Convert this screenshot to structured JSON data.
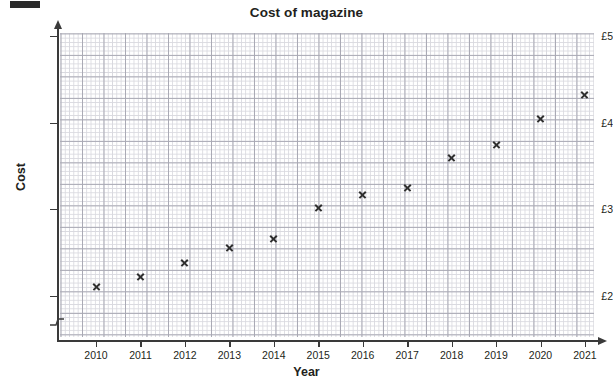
{
  "chart_data": {
    "type": "scatter",
    "title": "Cost of magazine",
    "xlabel": "Year",
    "ylabel": "Cost",
    "x": [
      2010,
      2011,
      2012,
      2013,
      2014,
      2015,
      2016,
      2017,
      2018,
      2019,
      2020,
      2021
    ],
    "values": [
      2.1,
      2.22,
      2.38,
      2.56,
      2.66,
      3.02,
      3.17,
      3.25,
      3.6,
      3.75,
      4.05,
      4.32
    ],
    "points": [
      {
        "year": 2010,
        "cost": 2.1
      },
      {
        "year": 2011,
        "cost": 2.22
      },
      {
        "year": 2012,
        "cost": 2.38
      },
      {
        "year": 2013,
        "cost": 2.56
      },
      {
        "year": 2014,
        "cost": 2.66
      },
      {
        "year": 2015,
        "cost": 3.02
      },
      {
        "year": 2016,
        "cost": 3.17
      },
      {
        "year": 2017,
        "cost": 3.25
      },
      {
        "year": 2018,
        "cost": 3.6
      },
      {
        "year": 2019,
        "cost": 3.75
      },
      {
        "year": 2020,
        "cost": 4.05
      },
      {
        "year": 2021,
        "cost": 4.32
      }
    ],
    "xlim": [
      2009.2,
      2021.5
    ],
    "ylim": [
      1.85,
      5.05
    ],
    "xticks": [
      2010,
      2011,
      2012,
      2013,
      2014,
      2015,
      2016,
      2017,
      2018,
      2019,
      2020,
      2021
    ],
    "xtick_labels": [
      "2010",
      "2011",
      "2012",
      "2013",
      "2014",
      "2015",
      "2016",
      "2017",
      "2018",
      "2019",
      "2020",
      "2021"
    ],
    "yticks": [
      2,
      3,
      4,
      5
    ],
    "ytick_labels": [
      "£2",
      "£3",
      "£4",
      "£5"
    ],
    "grid": true,
    "grid_style": "graph-paper minor and major squares",
    "legend": null,
    "axis_break": "y-axis broken below £2",
    "marker": "cross",
    "marker_color": "#2f2f2f"
  },
  "axis_icons": {
    "y_arrow": "arrow-up-icon",
    "x_arrow": "arrow-right-icon",
    "break": "axis-break-icon"
  }
}
